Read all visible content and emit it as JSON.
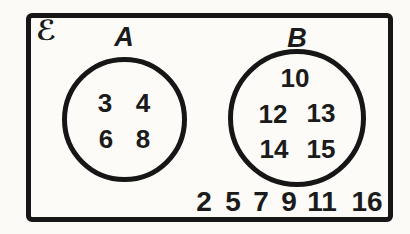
{
  "figure": {
    "type": "venn-set-diagram",
    "universal_set_symbol": "ℰ",
    "sets": {
      "a": {
        "label": "A",
        "elements": [
          "3",
          "4",
          "6",
          "8"
        ]
      },
      "b": {
        "label": "B",
        "elements": [
          "10",
          "12",
          "13",
          "14",
          "15"
        ]
      }
    },
    "outside_elements": [
      "2",
      "5",
      "7",
      "9",
      "11",
      "16"
    ],
    "colors": {
      "ink": "#161616",
      "paper": "#fbfaf7"
    }
  }
}
